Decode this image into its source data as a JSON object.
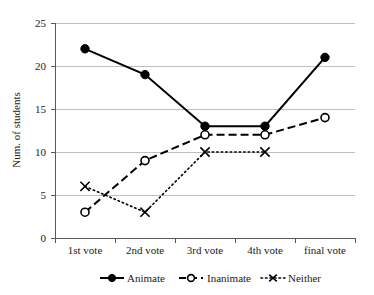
{
  "chart_data": {
    "type": "line",
    "title": "",
    "xlabel": "",
    "ylabel": "Num. of students",
    "categories": [
      "1st vote",
      "2nd vote",
      "3rd vote",
      "4th vote",
      "final vote"
    ],
    "ylim": [
      0,
      25
    ],
    "yticks": [
      "0",
      "5",
      "10",
      "15",
      "20",
      "25"
    ],
    "grid": "horizontal",
    "legend_position": "bottom",
    "series": [
      {
        "name": "Animate",
        "values": [
          22,
          19,
          13,
          13,
          21
        ],
        "line_style": "solid",
        "marker": "filled-circle",
        "color": "#000000"
      },
      {
        "name": "Inanimate",
        "values": [
          3,
          9,
          12,
          12,
          14
        ],
        "line_style": "dashed",
        "marker": "open-circle",
        "color": "#000000"
      },
      {
        "name": "Neither",
        "values": [
          6,
          3,
          10,
          10,
          null
        ],
        "line_style": "dotted",
        "marker": "x",
        "color": "#000000"
      }
    ]
  },
  "axes": {
    "y_title": "Num. of students",
    "y_tick_0": "0",
    "y_tick_1": "5",
    "y_tick_2": "10",
    "y_tick_3": "15",
    "y_tick_4": "20",
    "y_tick_5": "25",
    "x_tick_0": "1st vote",
    "x_tick_1": "2nd vote",
    "x_tick_2": "3rd vote",
    "x_tick_3": "4th vote",
    "x_tick_4": "final vote"
  },
  "legend": {
    "items": [
      {
        "label": "Animate",
        "marker": "filled-circle-icon",
        "line": "solid"
      },
      {
        "label": "Inanimate",
        "marker": "open-circle-icon",
        "line": "dashed"
      },
      {
        "label": "Neither",
        "marker": "x-marker-icon",
        "line": "dotted"
      }
    ]
  },
  "colors": {
    "ink": "#000000",
    "grid": "#bfbfbf",
    "axis": "#5a5a5a",
    "background": "#ffffff"
  }
}
